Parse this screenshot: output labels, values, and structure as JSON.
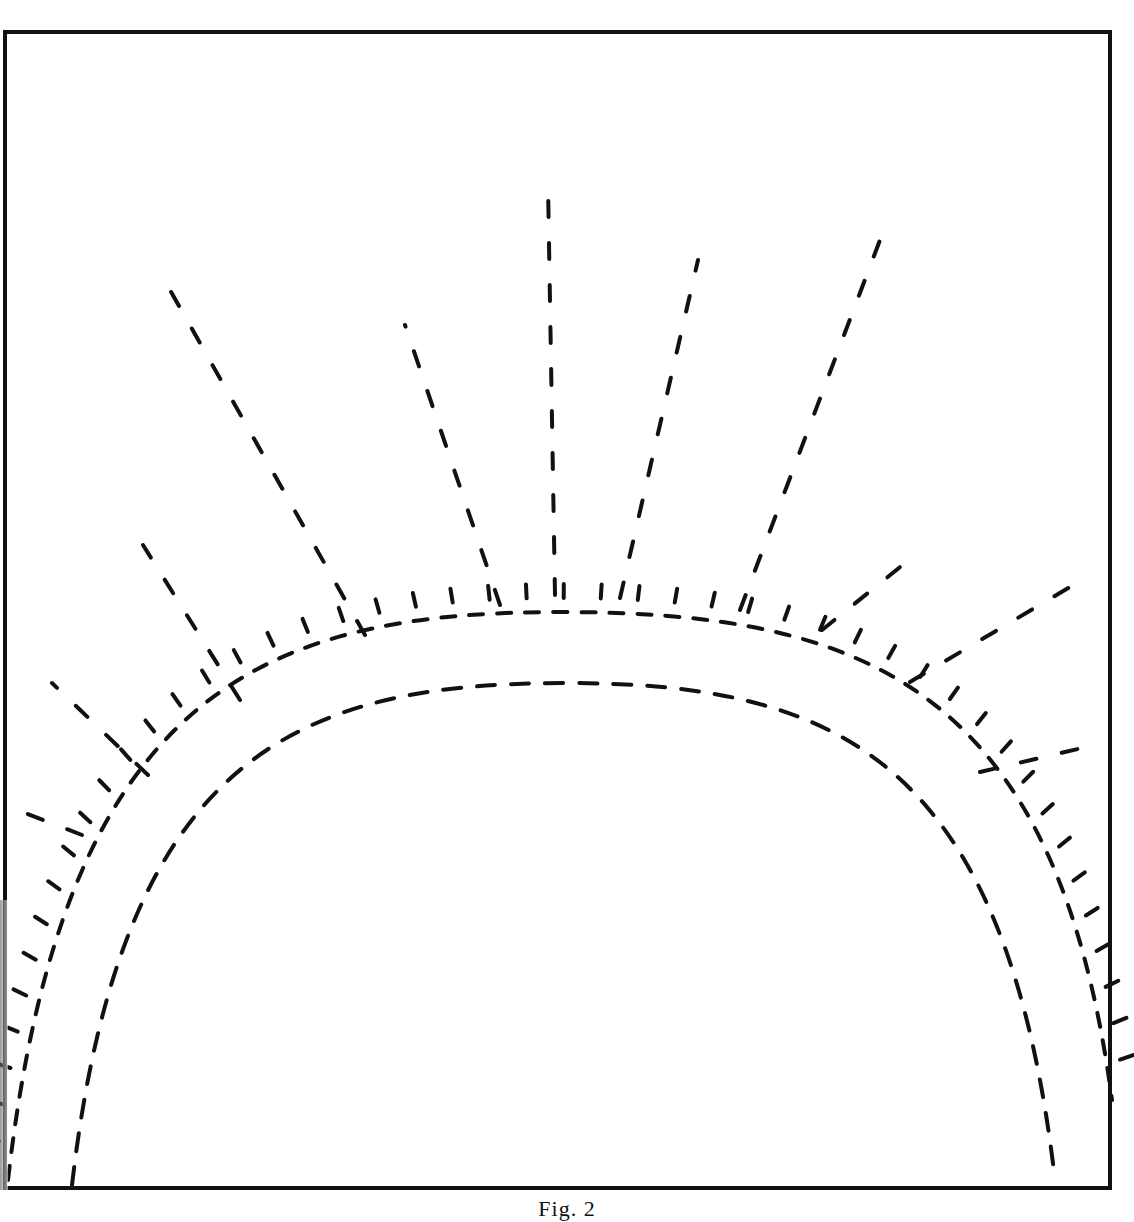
{
  "figure": {
    "caption": "Fig. 2",
    "stroke_color": "#111111",
    "background": "#ffffff",
    "frame": {
      "x1": 5,
      "y1": 32,
      "x2": 1110,
      "y2": 1188
    },
    "outer_arc": {
      "start": [
        8,
        1180
      ],
      "apex": [
        560,
        612
      ],
      "end": [
        1112,
        1100
      ],
      "dash": "14 14"
    },
    "inner_arc": {
      "start": [
        72,
        1185
      ],
      "apex": [
        565,
        683
      ],
      "end": [
        1055,
        1180
      ],
      "dash": "18 16"
    },
    "rays": [
      {
        "from": [
          555,
          595
        ],
        "to": [
          548,
          185
        ]
      },
      {
        "from": [
          620,
          598
        ],
        "to": [
          698,
          260
        ]
      },
      {
        "from": [
          740,
          610
        ],
        "to": [
          880,
          240
        ]
      },
      {
        "from": [
          822,
          630
        ],
        "to": [
          915,
          555
        ]
      },
      {
        "from": [
          910,
          682
        ],
        "to": [
          1085,
          578
        ]
      },
      {
        "from": [
          980,
          772
        ],
        "to": [
          1082,
          748
        ]
      },
      {
        "from": [
          500,
          605
        ],
        "to": [
          405,
          325
        ]
      },
      {
        "from": [
          365,
          635
        ],
        "to": [
          170,
          290
        ]
      },
      {
        "from": [
          240,
          700
        ],
        "to": [
          143,
          545
        ]
      },
      {
        "from": [
          148,
          775
        ],
        "to": [
          52,
          683
        ]
      },
      {
        "from": [
          82,
          835
        ],
        "to": [
          25,
          813
        ]
      }
    ],
    "tick_count": 48,
    "tick_length": 14
  }
}
